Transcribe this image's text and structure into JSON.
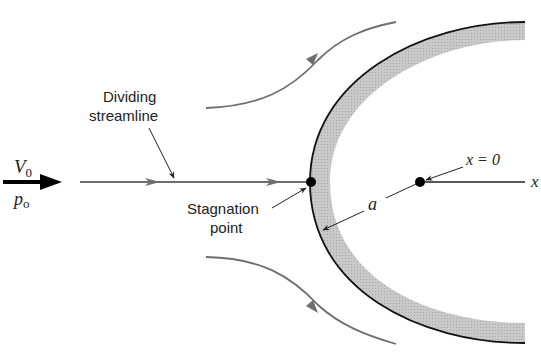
{
  "diagram": {
    "labels": {
      "velocity": "V",
      "velocity_sub": "0",
      "pressure": "p",
      "pressure_sub": "o",
      "dividing_line1": "Dividing",
      "dividing_line2": "streamline",
      "stagnation_line1": "Stagnation",
      "stagnation_line2": "point",
      "radius": "a",
      "origin": "x = 0",
      "axis": "x"
    },
    "colors": {
      "streamline": "#6e6e6e",
      "body_outline": "#111111",
      "body_fill": "#c4c4c4",
      "arrow": "#000000",
      "text": "#222222"
    }
  }
}
